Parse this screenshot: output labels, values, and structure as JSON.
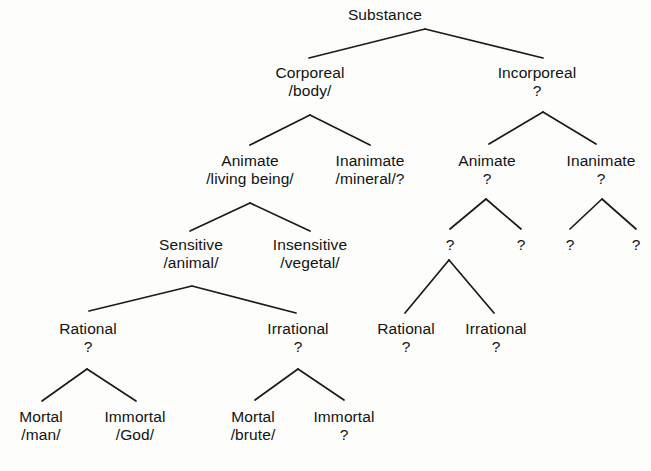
{
  "diagram": {
    "title": "Substance",
    "kind": "taxonomy-tree",
    "unknown_marker": "?",
    "line_color": "#1a1a1a",
    "background_color": "#fdfdfc",
    "text_color": "#121212",
    "nodes": [
      {
        "id": "substance",
        "term": "Substance",
        "gloss": "",
        "x": 385,
        "y": 6
      },
      {
        "id": "corporeal",
        "term": "Corporeal",
        "gloss": "/body/",
        "x": 310,
        "y": 64
      },
      {
        "id": "incorporeal",
        "term": "Incorporeal",
        "gloss": "?",
        "x": 537,
        "y": 64
      },
      {
        "id": "c-animate",
        "term": "Animate",
        "gloss": "/living being/",
        "x": 250,
        "y": 152
      },
      {
        "id": "c-inanimate",
        "term": "Inanimate",
        "gloss": "/mineral/?",
        "x": 370,
        "y": 152
      },
      {
        "id": "i-animate",
        "term": "Animate",
        "gloss": "?",
        "x": 487,
        "y": 152
      },
      {
        "id": "i-inanimate",
        "term": "Inanimate",
        "gloss": "?",
        "x": 601,
        "y": 152
      },
      {
        "id": "sensitive",
        "term": "Sensitive",
        "gloss": "/animal/",
        "x": 191,
        "y": 236
      },
      {
        "id": "insensitive",
        "term": "Insensitive",
        "gloss": "/vegetal/",
        "x": 310,
        "y": 236
      },
      {
        "id": "i-a-left",
        "term": "?",
        "gloss": "",
        "x": 450,
        "y": 236
      },
      {
        "id": "i-a-right",
        "term": "?",
        "gloss": "",
        "x": 521,
        "y": 236
      },
      {
        "id": "i-i-left",
        "term": "?",
        "gloss": "",
        "x": 570,
        "y": 236
      },
      {
        "id": "i-i-right",
        "term": "?",
        "gloss": "",
        "x": 636,
        "y": 236
      },
      {
        "id": "rational",
        "term": "Rational",
        "gloss": "?",
        "x": 88,
        "y": 320
      },
      {
        "id": "irrational",
        "term": "Irrational",
        "gloss": "?",
        "x": 298,
        "y": 320
      },
      {
        "id": "i-rational",
        "term": "Rational",
        "gloss": "?",
        "x": 406,
        "y": 320
      },
      {
        "id": "i-irrational",
        "term": "Irrational",
        "gloss": "?",
        "x": 496,
        "y": 320
      },
      {
        "id": "mortal-man",
        "term": "Mortal",
        "gloss": "/man/",
        "x": 41,
        "y": 408
      },
      {
        "id": "immortal-god",
        "term": "Immortal",
        "gloss": "/God/",
        "x": 135,
        "y": 408
      },
      {
        "id": "mortal-brute",
        "term": "Mortal",
        "gloss": "/brute/",
        "x": 253,
        "y": 408
      },
      {
        "id": "immortal-unknown",
        "term": "Immortal",
        "gloss": "?",
        "x": 344,
        "y": 408
      }
    ],
    "edges": [
      {
        "id": "substance-corporeal",
        "from": "substance",
        "to": "corporeal",
        "ax": 425,
        "ay": 29,
        "bx": 309,
        "by": 58
      },
      {
        "id": "substance-incorporeal",
        "from": "substance",
        "to": "incorporeal",
        "ax": 425,
        "ay": 29,
        "bx": 543,
        "by": 58
      },
      {
        "id": "corporeal-animate",
        "from": "corporeal",
        "to": "c-animate",
        "ax": 310,
        "ay": 115,
        "bx": 250,
        "by": 145
      },
      {
        "id": "corporeal-inanimate",
        "from": "corporeal",
        "to": "c-inanimate",
        "ax": 310,
        "ay": 115,
        "bx": 370,
        "by": 145
      },
      {
        "id": "incorporeal-animate",
        "from": "incorporeal",
        "to": "i-animate",
        "ax": 543,
        "ay": 112,
        "bx": 489,
        "by": 144
      },
      {
        "id": "incorporeal-inanimate",
        "from": "incorporeal",
        "to": "i-inanimate",
        "ax": 543,
        "ay": 112,
        "bx": 596,
        "by": 144
      },
      {
        "id": "animate-sensitive",
        "from": "c-animate",
        "to": "sensitive",
        "ax": 250,
        "ay": 203,
        "bx": 190,
        "by": 231
      },
      {
        "id": "animate-insensitive",
        "from": "c-animate",
        "to": "insensitive",
        "ax": 250,
        "ay": 203,
        "bx": 310,
        "by": 231
      },
      {
        "id": "ianimate-left",
        "from": "i-animate",
        "to": "i-a-left",
        "ax": 486,
        "ay": 199,
        "bx": 450,
        "by": 229
      },
      {
        "id": "ianimate-right",
        "from": "i-animate",
        "to": "i-a-right",
        "ax": 486,
        "ay": 199,
        "bx": 521,
        "by": 229
      },
      {
        "id": "iinanimate-left",
        "from": "i-inanimate",
        "to": "i-i-left",
        "ax": 602,
        "ay": 199,
        "bx": 570,
        "by": 229
      },
      {
        "id": "iinanimate-right",
        "from": "i-inanimate",
        "to": "i-i-right",
        "ax": 602,
        "ay": 199,
        "bx": 636,
        "by": 229
      },
      {
        "id": "sensitive-rational",
        "from": "sensitive",
        "to": "rational",
        "ax": 192,
        "ay": 286,
        "bx": 89,
        "by": 311
      },
      {
        "id": "sensitive-irrational",
        "from": "sensitive",
        "to": "irrational",
        "ax": 192,
        "ay": 286,
        "bx": 296,
        "by": 313
      },
      {
        "id": "ialeft-rational",
        "from": "i-a-left",
        "to": "i-rational",
        "ax": 449,
        "ay": 260,
        "bx": 405,
        "by": 313
      },
      {
        "id": "ialeft-irrational",
        "from": "i-a-left",
        "to": "i-irrational",
        "ax": 449,
        "ay": 260,
        "bx": 494,
        "by": 313
      },
      {
        "id": "rational-mortal",
        "from": "rational",
        "to": "mortal-man",
        "ax": 87,
        "ay": 369,
        "bx": 42,
        "by": 401
      },
      {
        "id": "rational-immortal",
        "from": "rational",
        "to": "immortal-god",
        "ax": 87,
        "ay": 369,
        "bx": 136,
        "by": 401
      },
      {
        "id": "irrational-mortal",
        "from": "irrational",
        "to": "mortal-brute",
        "ax": 298,
        "ay": 369,
        "bx": 255,
        "by": 400
      },
      {
        "id": "irrational-immortal",
        "from": "irrational",
        "to": "immortal-unknown",
        "ax": 298,
        "ay": 369,
        "bx": 344,
        "by": 400
      }
    ]
  }
}
